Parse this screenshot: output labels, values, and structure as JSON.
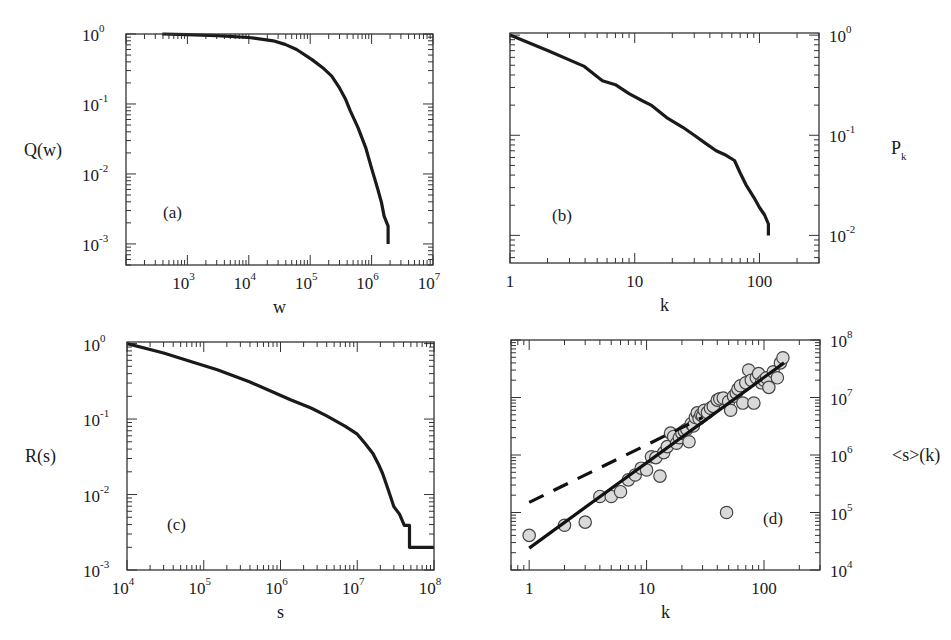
{
  "figure": {
    "background": "#ffffff",
    "line_color": "#1a1a1a",
    "marker_fill": "#d9d9d9",
    "marker_edge": "#444444"
  },
  "chart_data": [
    {
      "id": "a",
      "type": "line",
      "panel_label": "(a)",
      "title": "",
      "xlabel": "w",
      "ylabel": "Q(w)",
      "ylabel_side": "left",
      "xscale": "log",
      "yscale": "log",
      "xlim": [
        100,
        10000000
      ],
      "ylim": [
        0.0005,
        1
      ],
      "xticks": [
        {
          "v": 1000,
          "base": "10",
          "exp": "3"
        },
        {
          "v": 10000,
          "base": "10",
          "exp": "4"
        },
        {
          "v": 100000,
          "base": "10",
          "exp": "5"
        },
        {
          "v": 1000000,
          "base": "10",
          "exp": "6"
        },
        {
          "v": 10000000,
          "base": "10",
          "exp": "7"
        }
      ],
      "yticks": [
        {
          "v": 1,
          "base": "10",
          "exp": "0"
        },
        {
          "v": 0.1,
          "base": "10",
          "exp": "-1"
        },
        {
          "v": 0.01,
          "base": "10",
          "exp": "-2"
        },
        {
          "v": 0.001,
          "base": "10",
          "exp": "-3"
        }
      ],
      "grid": false,
      "series": [
        {
          "name": "Q(w)",
          "style": "solid",
          "x": [
            390,
            1000,
            3000,
            10000,
            25000,
            39000,
            60000,
            107000,
            160000,
            224000,
            300000,
            372000,
            450000,
            600000,
            800000,
            1000000,
            1250000,
            1450000,
            1600000,
            1860000,
            1860000
          ],
          "y": [
            1,
            0.98,
            0.95,
            0.89,
            0.8,
            0.71,
            0.6,
            0.43,
            0.33,
            0.25,
            0.17,
            0.12,
            0.08,
            0.046,
            0.024,
            0.012,
            0.0062,
            0.0039,
            0.0025,
            0.0018,
            0.001
          ]
        }
      ]
    },
    {
      "id": "b",
      "type": "line",
      "panel_label": "(b)",
      "title": "",
      "xlabel": "k",
      "ylabel": "P_k",
      "ylabel_side": "right",
      "xscale": "log",
      "yscale": "log",
      "xlim": [
        1,
        300
      ],
      "ylim": [
        0.0053,
        1.05
      ],
      "xticks": [
        {
          "v": 1,
          "label": "1"
        },
        {
          "v": 10,
          "label": "10"
        },
        {
          "v": 100,
          "label": "100"
        }
      ],
      "yticks": [
        {
          "v": 1,
          "base": "10",
          "exp": "0"
        },
        {
          "v": 0.1,
          "base": "10",
          "exp": "-1"
        },
        {
          "v": 0.01,
          "base": "10",
          "exp": "-2"
        }
      ],
      "grid": false,
      "series": [
        {
          "name": "P_k",
          "style": "solid",
          "x": [
            1,
            2,
            3.9,
            5.5,
            7,
            9,
            11.6,
            13.5,
            18,
            24.3,
            30,
            37,
            45,
            54,
            63,
            70,
            78,
            90,
            100,
            110,
            118,
            118
          ],
          "y": [
            1,
            0.7,
            0.49,
            0.35,
            0.32,
            0.26,
            0.22,
            0.2,
            0.15,
            0.12,
            0.1,
            0.083,
            0.07,
            0.063,
            0.056,
            0.042,
            0.032,
            0.024,
            0.019,
            0.016,
            0.013,
            0.01
          ]
        }
      ]
    },
    {
      "id": "c",
      "type": "line",
      "panel_label": "(c)",
      "title": "",
      "xlabel": "s",
      "ylabel": "R(s)",
      "ylabel_side": "left",
      "xscale": "log",
      "yscale": "log",
      "xlim": [
        10000,
        100000000
      ],
      "ylim": [
        0.001,
        1.05
      ],
      "xticks": [
        {
          "v": 10000,
          "base": "10",
          "exp": "4"
        },
        {
          "v": 100000,
          "base": "10",
          "exp": "5"
        },
        {
          "v": 1000000,
          "base": "10",
          "exp": "6"
        },
        {
          "v": 10000000,
          "base": "10",
          "exp": "7"
        },
        {
          "v": 100000000,
          "base": "10",
          "exp": "8"
        }
      ],
      "yticks": [
        {
          "v": 1,
          "base": "10",
          "exp": "0"
        },
        {
          "v": 0.1,
          "base": "10",
          "exp": "-1"
        },
        {
          "v": 0.01,
          "base": "10",
          "exp": "-2"
        },
        {
          "v": 0.001,
          "base": "10",
          "exp": "-3"
        }
      ],
      "grid": false,
      "series": [
        {
          "name": "R(s)",
          "style": "solid",
          "x": [
            10000,
            30000,
            71000,
            150000,
            400000,
            1350000,
            2500000,
            4000000,
            7000000,
            10000000,
            12500000,
            16000000,
            19000000,
            21400000,
            25000000,
            30000000,
            35500000,
            41000000,
            47900000,
            47900000,
            100000000
          ],
          "y": [
            1,
            0.75,
            0.57,
            0.45,
            0.31,
            0.18,
            0.14,
            0.11,
            0.08,
            0.063,
            0.048,
            0.035,
            0.025,
            0.019,
            0.012,
            0.0069,
            0.0055,
            0.0039,
            0.0039,
            0.002,
            0.002
          ]
        }
      ]
    },
    {
      "id": "d",
      "type": "scatter",
      "panel_label": "(d)",
      "title": "",
      "xlabel": "k",
      "ylabel": "<s>(k)",
      "ylabel_side": "right",
      "xscale": "log",
      "yscale": "log",
      "xlim": [
        0.7,
        300
      ],
      "ylim": [
        10000,
        100000000
      ],
      "xticks": [
        {
          "v": 1,
          "label": "1"
        },
        {
          "v": 10,
          "label": "10"
        },
        {
          "v": 100,
          "label": "100"
        }
      ],
      "yticks": [
        {
          "v": 100000000,
          "base": "10",
          "exp": "8"
        },
        {
          "v": 10000000,
          "base": "10",
          "exp": "7"
        },
        {
          "v": 1000000,
          "base": "10",
          "exp": "6"
        },
        {
          "v": 100000,
          "base": "10",
          "exp": "5"
        },
        {
          "v": 10000,
          "base": "10",
          "exp": "4"
        }
      ],
      "grid": false,
      "series": [
        {
          "name": "data",
          "style": "markers",
          "x": [
            1,
            2,
            3,
            4,
            5,
            6,
            7,
            8,
            9,
            10,
            11,
            12,
            13,
            14,
            15,
            16,
            17,
            18,
            19,
            20,
            21,
            22,
            23,
            24,
            25,
            26,
            27,
            28,
            29,
            30,
            31,
            33,
            35,
            37,
            40,
            42,
            45,
            48,
            50,
            52,
            55,
            58,
            60,
            63,
            66,
            70,
            74,
            78,
            82,
            86,
            90,
            95,
            100,
            105,
            110,
            120,
            130,
            138,
            145
          ],
          "y": [
            40000,
            60000,
            68000,
            190000,
            190000,
            230000,
            370000,
            450000,
            590000,
            550000,
            930000,
            900000,
            430000,
            1100000,
            1400000,
            2400000,
            2100000,
            1600000,
            2000000,
            2400000,
            2600000,
            2800000,
            1700000,
            3500000,
            3200000,
            4500000,
            5400000,
            4300000,
            5000000,
            4800000,
            6000000,
            5500000,
            6500000,
            7000000,
            9000000,
            9500000,
            9800000,
            100000,
            8500000,
            6000000,
            10500000,
            12000000,
            14000000,
            16000000,
            8000000,
            18000000,
            30000000,
            20000000,
            8000000,
            22000000,
            26000000,
            18000000,
            20000000,
            22000000,
            15000000,
            28000000,
            22000000,
            40000000,
            49000000
          ]
        },
        {
          "name": "fit k^1.5",
          "style": "solid",
          "x": [
            1,
            148
          ],
          "y": [
            24000,
            40000000
          ]
        },
        {
          "name": "fit k^1",
          "style": "dashed",
          "x": [
            1,
            30
          ],
          "y": [
            150000,
            4500000
          ]
        }
      ]
    }
  ]
}
